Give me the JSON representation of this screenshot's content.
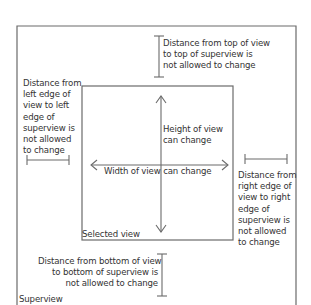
{
  "diagram": {
    "superview": {
      "label": "Superview"
    },
    "selected_view": {
      "label": "Selected view"
    },
    "annotations": {
      "top": "Distance from top of view\nto top of superview is\nnot allowed to change",
      "left": "Distance from\nleft edge of\nview to left\nedge of\nsuperview is\nnot allowed\nto change",
      "right": "Distance from\nright edge of\nview to right\nedge of\nsuperview is\nnot allowed\nto change",
      "bottom": "Distance from bottom of view\nto bottom of superview is\nnot allowed to change",
      "height": "Height of view\ncan change",
      "width": "Width of view can change"
    },
    "colors": {
      "line": "#6b6b6b",
      "text": "#333333",
      "background": "#ffffff"
    }
  }
}
